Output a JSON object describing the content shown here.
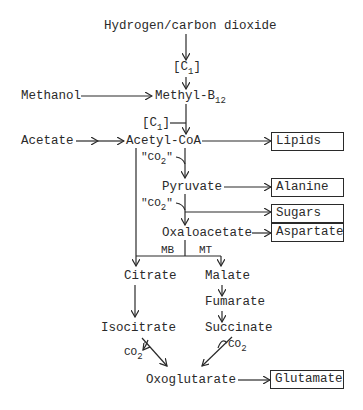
{
  "diagram": {
    "nodes": {
      "hydrogen_co2": "Hydrogen/carbon dioxide",
      "c1_top": {
        "main": "[C",
        "sub": "1",
        "close": "]"
      },
      "methanol": "Methanol",
      "methyl_b12": {
        "main": "Methyl-B",
        "sub": "12"
      },
      "c1_mid": {
        "main": "[C",
        "sub": "1",
        "close": "]"
      },
      "acetate": "Acetate",
      "acetyl_coa": "Acetyl-CoA",
      "co2_quote_1": {
        "main": "\"CO",
        "sub": "2",
        "close": "\""
      },
      "pyruvate": "Pyruvate",
      "co2_quote_2": {
        "main": "\"CO",
        "sub": "2",
        "close": "\""
      },
      "oxaloacetate": "Oxaloacetate",
      "mb": "MB",
      "mt": "MT",
      "citrate": "Citrate",
      "malate": "Malate",
      "fumarate": "Fumarate",
      "isocitrate": "Isocitrate",
      "succinate": "Succinate",
      "co2_left": {
        "main": "CO",
        "sub": "2"
      },
      "co2_right": {
        "main": "CO",
        "sub": "2"
      },
      "oxoglutarate": "Oxoglutarate"
    },
    "products": {
      "lipids": "Lipids",
      "alanine": "Alanine",
      "sugars": "Sugars",
      "aspartate": "Aspartate",
      "glutamate": "Glutamate"
    }
  }
}
